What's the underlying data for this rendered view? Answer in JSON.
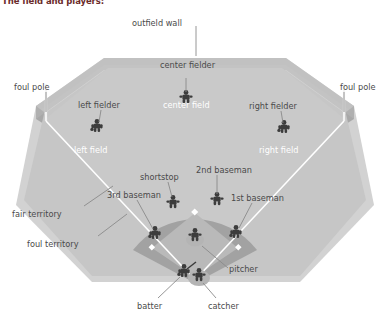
{
  "title": "The field and players:",
  "colors": {
    "outfield_grass": "#c9c9c9",
    "infield_grass": "#bdbdbd",
    "infield_dirt": "#9e9e9e",
    "wall_face": "#b0b0b0",
    "wall_top": "#cfcfcf",
    "foul_line": "#ffffff",
    "figure": "#3c3c3c",
    "label_text": "#4a4a4a",
    "zone_text": "#ffffff",
    "title_text": "#6b2b2b",
    "background": "#ffffff"
  },
  "labels": {
    "outfield_wall": "outfield wall",
    "foul_pole_left": "foul pole",
    "foul_pole_right": "foul pole",
    "left_fielder": "left fielder",
    "center_fielder": "center fielder",
    "right_fielder": "right fielder",
    "shortstop": "shortstop",
    "second_baseman": "2nd baseman",
    "third_baseman": "3rd baseman",
    "first_baseman": "1st baseman",
    "pitcher": "pitcher",
    "catcher": "catcher",
    "batter": "batter",
    "fair_territory": "fair territory",
    "foul_territory": "foul territory"
  },
  "zones": {
    "left_field": "left field",
    "center_field": "center field",
    "right_field": "right field"
  },
  "diagram_data": {
    "type": "annotated-diagram",
    "subject": "baseball field and player positions",
    "positions": [
      {
        "name": "left fielder",
        "x": 97,
        "y": 125
      },
      {
        "name": "center fielder",
        "x": 186,
        "y": 96
      },
      {
        "name": "right fielder",
        "x": 284,
        "y": 126
      },
      {
        "name": "shortstop",
        "x": 173,
        "y": 201
      },
      {
        "name": "2nd baseman",
        "x": 217,
        "y": 198
      },
      {
        "name": "3rd baseman",
        "x": 155,
        "y": 232
      },
      {
        "name": "1st baseman",
        "x": 236,
        "y": 231
      },
      {
        "name": "pitcher",
        "x": 195,
        "y": 233
      },
      {
        "name": "batter",
        "x": 184,
        "y": 268
      },
      {
        "name": "catcher",
        "x": 199,
        "y": 272
      }
    ],
    "field_regions": [
      "left field",
      "center field",
      "right field",
      "fair territory",
      "foul territory"
    ],
    "markers": [
      "outfield wall",
      "foul pole (left)",
      "foul pole (right)",
      "pitcher's mound",
      "home plate",
      "bases"
    ]
  }
}
